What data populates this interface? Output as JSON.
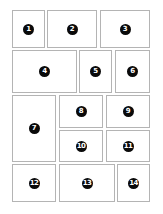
{
  "layout": {
    "title": "Numbered grid layout",
    "cells": [
      {
        "label": "1",
        "x": 12,
        "y": 10,
        "w": 33,
        "h": 38
      },
      {
        "label": "2",
        "x": 47,
        "y": 10,
        "w": 50,
        "h": 38
      },
      {
        "label": "3",
        "x": 100,
        "y": 10,
        "w": 50,
        "h": 38
      },
      {
        "label": "4",
        "x": 12,
        "y": 50,
        "w": 65,
        "h": 43
      },
      {
        "label": "5",
        "x": 79,
        "y": 50,
        "w": 33,
        "h": 43
      },
      {
        "label": "6",
        "x": 115,
        "y": 50,
        "w": 35,
        "h": 43
      },
      {
        "label": "7",
        "x": 12,
        "y": 95,
        "w": 44,
        "h": 67
      },
      {
        "label": "8",
        "x": 59,
        "y": 95,
        "w": 44,
        "h": 33
      },
      {
        "label": "9",
        "x": 106,
        "y": 95,
        "w": 44,
        "h": 33
      },
      {
        "label": "10",
        "x": 59,
        "y": 130,
        "w": 44,
        "h": 32
      },
      {
        "label": "11",
        "x": 106,
        "y": 130,
        "w": 44,
        "h": 32
      },
      {
        "label": "12",
        "x": 12,
        "y": 164,
        "w": 44,
        "h": 38
      },
      {
        "label": "13",
        "x": 59,
        "y": 164,
        "w": 56,
        "h": 38
      },
      {
        "label": "14",
        "x": 117,
        "y": 164,
        "w": 33,
        "h": 38
      }
    ]
  },
  "colors": {
    "border": "#b4b4b4",
    "badge_bg": "#0a0a0a",
    "badge_text": "#ffffff",
    "background": "#ffffff"
  }
}
